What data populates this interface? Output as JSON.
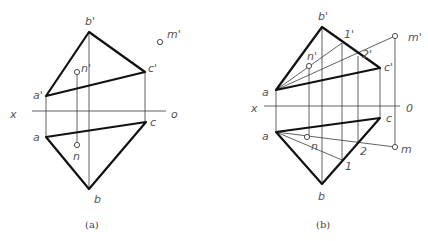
{
  "figure_a": {
    "caption": "(a)",
    "labels": {
      "b_prime": "b'",
      "m_prime": "m'",
      "n_prime": "n'",
      "c_prime": "c'",
      "a_prime": "a'",
      "x": "x",
      "o": "o",
      "a": "a",
      "c": "c",
      "n": "n",
      "b": "b"
    }
  },
  "figure_b": {
    "caption": "(b)",
    "labels": {
      "b_prime": "b'",
      "one_prime": "1'",
      "m_prime": "m'",
      "n_prime": "n'",
      "two_prime": "2'",
      "c_prime": "c'",
      "a_prime": "a",
      "x": "x",
      "o": "0",
      "c": "c",
      "a": "a",
      "n": "n",
      "m": "m",
      "two": "2",
      "one": "1",
      "b": "b"
    }
  },
  "colors": {
    "line": "#111111",
    "thin_line": "#3a3a3a",
    "label": "#555555",
    "background": "#ffffff"
  }
}
